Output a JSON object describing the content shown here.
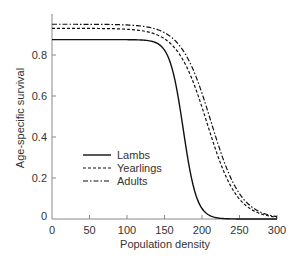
{
  "chart_data": {
    "type": "line",
    "title": "",
    "xlabel": "Population density",
    "ylabel": "Age-specific survival",
    "xlim": [
      0,
      300
    ],
    "ylim": [
      0,
      1.0
    ],
    "xticks": [
      0,
      50,
      100,
      150,
      200,
      250,
      300
    ],
    "yticks": [
      0,
      0.2,
      0.4,
      0.6,
      0.8
    ],
    "ytick_labels": [
      "0",
      "0.2",
      "0.4",
      "0.6",
      "0.8"
    ],
    "grid": false,
    "legend_position": "center-left",
    "series": [
      {
        "name": "Lambs",
        "style": "solid",
        "max": 0.875,
        "midpoint": 175,
        "scale": 9,
        "x": [
          0,
          50,
          100,
          125,
          150,
          160,
          170,
          175,
          180,
          190,
          200,
          210,
          225,
          250,
          275,
          300
        ],
        "values": [
          0.875,
          0.875,
          0.875,
          0.87,
          0.82,
          0.74,
          0.55,
          0.44,
          0.33,
          0.17,
          0.08,
          0.04,
          0.015,
          0.003,
          0.001,
          0.0
        ]
      },
      {
        "name": "Yearlings",
        "style": "dashed",
        "max": 0.93,
        "midpoint": 207,
        "scale": 20,
        "x": [
          0,
          50,
          100,
          125,
          150,
          175,
          200,
          210,
          225,
          250,
          275,
          300
        ],
        "values": [
          0.93,
          0.93,
          0.93,
          0.92,
          0.88,
          0.77,
          0.55,
          0.43,
          0.28,
          0.11,
          0.05,
          0.03
        ]
      },
      {
        "name": "Adults",
        "style": "dash-dot",
        "max": 0.95,
        "midpoint": 212,
        "scale": 20,
        "x": [
          0,
          50,
          100,
          125,
          150,
          175,
          200,
          210,
          225,
          250,
          275,
          300
        ],
        "values": [
          0.95,
          0.95,
          0.95,
          0.94,
          0.91,
          0.81,
          0.61,
          0.49,
          0.33,
          0.14,
          0.07,
          0.04
        ]
      }
    ]
  }
}
